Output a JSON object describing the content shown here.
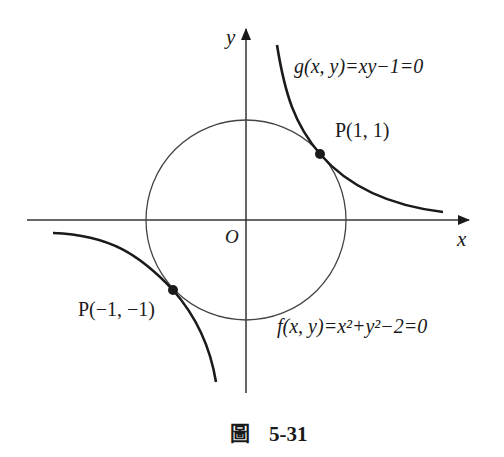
{
  "figure": {
    "caption_prefix": "圖",
    "caption_number": "5-31",
    "axes": {
      "x_label": "x",
      "y_label": "y",
      "origin_label": "O"
    },
    "curves": {
      "hyperbola": {
        "label": "g(x, y)=xy−1=0",
        "equation": "xy - 1 = 0"
      },
      "circle": {
        "label": "f(x, y)=x²+y²−2=0",
        "equation": "x^2 + y^2 - 2 = 0",
        "radius_squared": 2
      }
    },
    "points": [
      {
        "label": "P(1, 1)",
        "x": 1,
        "y": 1
      },
      {
        "label": "P(−1, −1)",
        "x": -1,
        "y": -1
      }
    ],
    "colors": {
      "ink": "#1a1a1a",
      "circle": "#444444",
      "axis": "#333333"
    }
  }
}
